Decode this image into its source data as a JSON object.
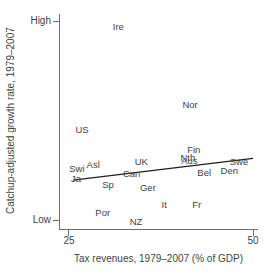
{
  "figure": {
    "background": "#ffffff",
    "text_color": "#3f3f3f",
    "axis_color": "#6e6e6e",
    "trend_line_color": "#1f1f1f"
  },
  "chart_data": {
    "type": "scatter",
    "title": "",
    "xlabel": "Tax revenues, 1979–2007 (% of GDP)",
    "ylabel": "Catchup-adjusted growth rate, 1979–2007",
    "x_ticks": [
      25,
      50
    ],
    "y_tick_labels": [
      "High",
      "Low"
    ],
    "xlim": [
      23.8,
      50.7
    ],
    "ylim_relative": [
      0,
      1
    ],
    "grid": false,
    "legend": "none",
    "marker_style": "country-abbreviation text labels (no dot markers)",
    "y_axis_note": "qualitative scale from Low to High; point y-values are relative 0–1 estimates",
    "points": [
      {
        "label": "Ire",
        "x": 31.8,
        "y": 0.97
      },
      {
        "label": "Nor",
        "x": 41.5,
        "y": 0.578
      },
      {
        "label": "US",
        "x": 26.9,
        "y": 0.452
      },
      {
        "label": "Fin",
        "x": 42.0,
        "y": 0.352
      },
      {
        "label": "Nth",
        "x": 41.2,
        "y": 0.312
      },
      {
        "label": "Aus",
        "x": 41.4,
        "y": 0.296
      },
      {
        "label": "UK",
        "x": 34.9,
        "y": 0.291
      },
      {
        "label": "Swe",
        "x": 48.1,
        "y": 0.291
      },
      {
        "label": "Asl",
        "x": 28.4,
        "y": 0.276
      },
      {
        "label": "Swi",
        "x": 26.2,
        "y": 0.256
      },
      {
        "label": "Den",
        "x": 46.8,
        "y": 0.246
      },
      {
        "label": "Bel",
        "x": 43.4,
        "y": 0.236
      },
      {
        "label": "Can",
        "x": 33.6,
        "y": 0.231
      },
      {
        "label": "Ja",
        "x": 26.1,
        "y": 0.206
      },
      {
        "label": "Sp",
        "x": 30.4,
        "y": 0.176
      },
      {
        "label": "Ger",
        "x": 35.8,
        "y": 0.161
      },
      {
        "label": "It",
        "x": 38.0,
        "y": 0.075
      },
      {
        "label": "Fr",
        "x": 42.4,
        "y": 0.075
      },
      {
        "label": "Por",
        "x": 29.7,
        "y": 0.035
      },
      {
        "label": "NZ",
        "x": 34.2,
        "y": -0.01
      }
    ],
    "trend_line": {
      "x1": 25.7,
      "y1": 0.2,
      "x2": 50.0,
      "y2": 0.31
    }
  }
}
